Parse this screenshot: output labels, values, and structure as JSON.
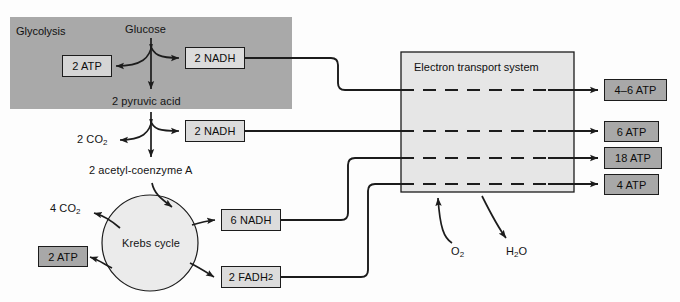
{
  "diagram": {
    "regions": {
      "glycolysis": {
        "label": "Glycolysis",
        "fill": "#a9a9a9"
      },
      "electron_transport": {
        "label": "Electron transport system",
        "fill": "#e6e6e6"
      },
      "krebs": {
        "label": "Krebs cycle",
        "fill": "#ebebeb"
      }
    },
    "metabolites": {
      "glucose": "Glucose",
      "pyruvic_acid": "2 pyruvic acid",
      "acetyl_coa": "2 acetyl-coenzyme A",
      "co2_pyruvate": "2 CO",
      "co2_pyruvate_sub": "2",
      "co2_krebs": "4 CO",
      "co2_krebs_sub": "2",
      "oxygen": "O",
      "oxygen_sub": "2",
      "water_h": "H",
      "water_sub": "2",
      "water_o": "O"
    },
    "carriers": {
      "glycolysis_nadh": "2 NADH",
      "pyruvate_nadh": "2 NADH",
      "krebs_nadh": "6 NADH",
      "krebs_fadh2_pre": "2 FADH",
      "krebs_fadh2_sub": "2"
    },
    "atp_yields": {
      "glycolysis_atp": "2 ATP",
      "krebs_atp": "2 ATP",
      "ets_outputs": [
        {
          "label": "4–6 ATP",
          "source": "glycolysis_nadh"
        },
        {
          "label": "6 ATP",
          "source": "pyruvate_nadh"
        },
        {
          "label": "18 ATP",
          "source": "krebs_nadh"
        },
        {
          "label": "4 ATP",
          "source": "krebs_fadh2"
        }
      ]
    },
    "colors": {
      "stroke": "#1c1c1c",
      "glycolysis_fill": "#a9a9a9",
      "ets_fill": "#e6e6e6",
      "krebs_fill": "#ebebeb",
      "atp_dark": "#a8a8a8",
      "nadh_fill": "#dcdcdc",
      "background": "#fdfdfd"
    }
  }
}
